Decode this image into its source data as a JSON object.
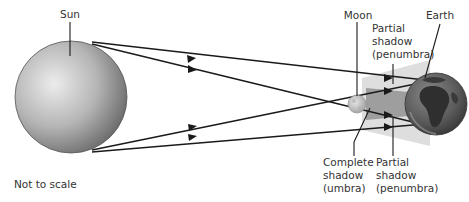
{
  "diagram": {
    "colors": {
      "sun_light": "#e8e8e8",
      "sun_dark": "#6e6e6e",
      "earth_ocean": "#555555",
      "earth_land": "#3a3a3a",
      "moon": "#c9c9c9",
      "umbra": "#9a9a9a",
      "penumbra": "#dcdcdc",
      "line": "#1a1a1a",
      "text": "#333333"
    },
    "labels": {
      "sun": "Sun",
      "moon": "Moon",
      "earth": "Earth",
      "penumbra_top": [
        "Partial",
        "shadow",
        "(penumbra)"
      ],
      "umbra": [
        "Complete",
        "shadow",
        "(umbra)"
      ],
      "penumbra_bottom": [
        "Partial",
        "shadow",
        "(penumbra)"
      ],
      "note": "Not to scale"
    }
  }
}
